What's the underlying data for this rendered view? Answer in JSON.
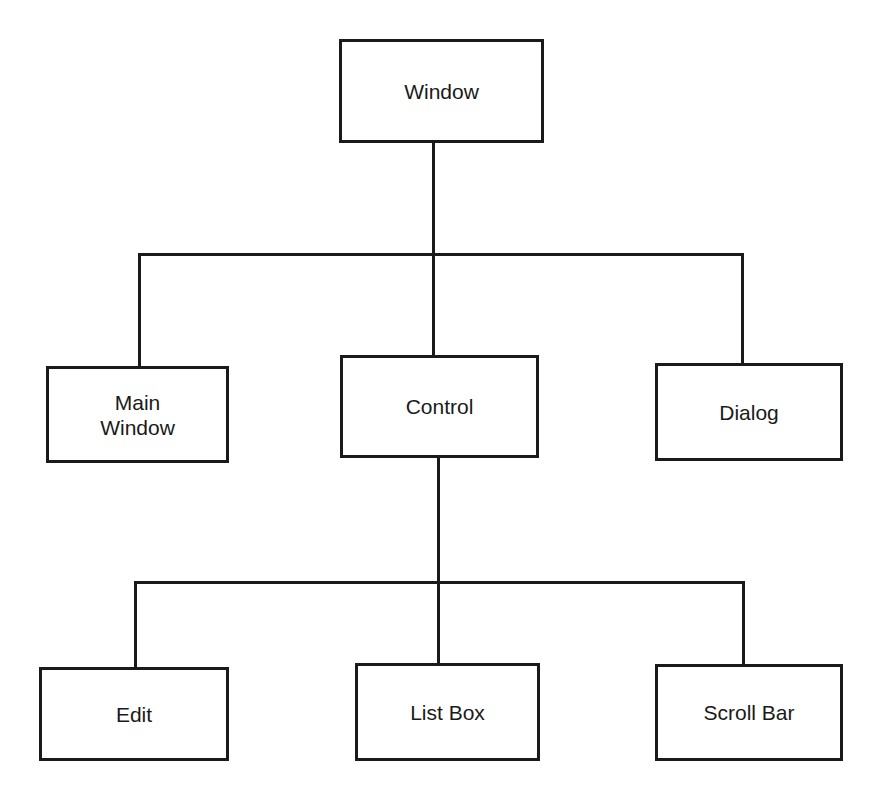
{
  "diagram": {
    "type": "hierarchy-tree",
    "root": {
      "label": "Window",
      "children": [
        {
          "label": "Main\nWindow"
        },
        {
          "label": "Control",
          "children": [
            {
              "label": "Edit"
            },
            {
              "label": "List Box"
            },
            {
              "label": "Scroll Bar"
            }
          ]
        },
        {
          "label": "Dialog"
        }
      ]
    },
    "nodes": {
      "window": "Window",
      "main_window": "Main\nWindow",
      "control": "Control",
      "dialog": "Dialog",
      "edit": "Edit",
      "list_box": "List Box",
      "scroll_bar": "Scroll Bar"
    },
    "colors": {
      "stroke": "#1a1a1a",
      "background": "#ffffff",
      "text": "#1a1a1a"
    }
  }
}
